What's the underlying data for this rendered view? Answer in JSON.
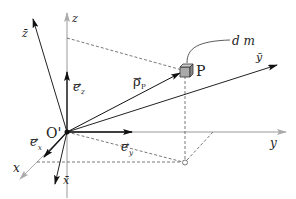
{
  "diagram": {
    "type": "3d-coordinate-frames",
    "origin": {
      "label": "O'"
    },
    "point": {
      "label": "P"
    },
    "mass_element": {
      "label": "d m"
    },
    "position_vector": {
      "label": "ρ",
      "subscript": "P",
      "arrow": "→"
    },
    "axes": {
      "fixed": {
        "x": {
          "label": "x"
        },
        "y": {
          "label": "y"
        },
        "z": {
          "label": "z"
        }
      },
      "body": {
        "x_bar": {
          "label": "x̄"
        },
        "y_bar": {
          "label": "ȳ"
        },
        "z_bar": {
          "label": "z̄"
        }
      }
    },
    "unit_vectors": {
      "ex": {
        "label": "e",
        "subscript": "x",
        "arrow": "→"
      },
      "ey": {
        "label": "e",
        "subscript": "y",
        "arrow": "→"
      },
      "ez": {
        "label": "e",
        "subscript": "z",
        "arrow": "→"
      }
    },
    "colors": {
      "body_axes": "#222222",
      "fixed_axes": "#999999",
      "dashed": "#555555",
      "cube": "#aaaaaa"
    }
  }
}
